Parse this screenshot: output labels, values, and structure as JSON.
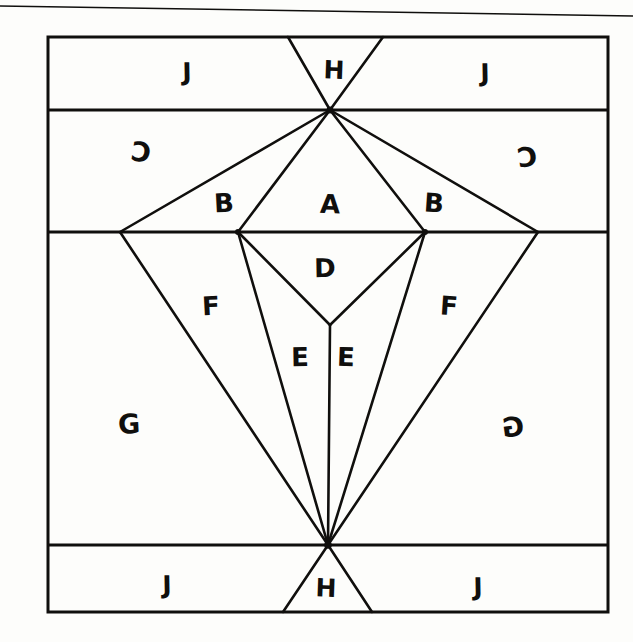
{
  "document": {
    "title": "Hand-drawn geometric partition diagram",
    "background_color": "#fdfdfb",
    "ink_color": "#100f0d"
  },
  "scan_artifact": {
    "name": "page-edge-line",
    "description": "thin slanted scan line across the top of the page",
    "x1": 0,
    "y1": 6,
    "x2": 633,
    "y2": 16
  },
  "frame": {
    "left": 48,
    "top": 37,
    "right": 608,
    "bottom": 612,
    "stroke_width": 3
  },
  "guides": {
    "horizontal_lines": [
      110,
      232,
      545
    ]
  },
  "vertices": {
    "top_apex": {
      "x": 330,
      "y": 110
    },
    "bottom_apex": {
      "x": 328,
      "y": 545
    },
    "diamond_bottom": {
      "x": 330,
      "y": 325
    },
    "mid_outer_left": {
      "x": 120,
      "y": 232
    },
    "mid_inner_left": {
      "x": 238,
      "y": 232
    },
    "mid_inner_right": {
      "x": 425,
      "y": 232
    },
    "mid_outer_right": {
      "x": 538,
      "y": 232
    },
    "top_h_left": {
      "x": 288,
      "y": 37
    },
    "top_h_right": {
      "x": 383,
      "y": 37
    },
    "bottom_h_left": {
      "x": 283,
      "y": 612
    },
    "bottom_h_right": {
      "x": 372,
      "y": 612
    }
  },
  "labels": [
    {
      "id": "j-top-left",
      "text": "J",
      "x": 187,
      "y": 72,
      "size": 25,
      "style": "lbl-rot-c"
    },
    {
      "id": "h-top",
      "text": "H",
      "x": 334,
      "y": 70,
      "size": 25,
      "style": "lbl-rot-b"
    },
    {
      "id": "j-top-right",
      "text": "J",
      "x": 485,
      "y": 73,
      "size": 25,
      "style": "lbl-rot-c"
    },
    {
      "id": "c-left",
      "text": "C",
      "x": 141,
      "y": 152,
      "size": 27,
      "style": "lbl-flip"
    },
    {
      "id": "c-right",
      "text": "C",
      "x": 527,
      "y": 157,
      "size": 27,
      "style": "lbl-flip2"
    },
    {
      "id": "b-left",
      "text": "B",
      "x": 224,
      "y": 203,
      "size": 26,
      "style": "lbl-rot-a"
    },
    {
      "id": "a-center",
      "text": "A",
      "x": 330,
      "y": 204,
      "size": 26,
      "style": "lbl-rot-b"
    },
    {
      "id": "b-right",
      "text": "B",
      "x": 434,
      "y": 203,
      "size": 26,
      "style": "lbl-rot-d"
    },
    {
      "id": "d-center",
      "text": "D",
      "x": 325,
      "y": 268,
      "size": 26,
      "style": "lbl-rot-c"
    },
    {
      "id": "f-left",
      "text": "F",
      "x": 211,
      "y": 306,
      "size": 26,
      "style": "lbl-rot-a"
    },
    {
      "id": "f-right",
      "text": "F",
      "x": 449,
      "y": 306,
      "size": 26,
      "style": "lbl-rot-d"
    },
    {
      "id": "e-left",
      "text": "E",
      "x": 300,
      "y": 357,
      "size": 26,
      "style": "lbl-rot-c"
    },
    {
      "id": "e-right",
      "text": "E",
      "x": 346,
      "y": 357,
      "size": 26,
      "style": "lbl-rot-b"
    },
    {
      "id": "g-left",
      "text": "G",
      "x": 129,
      "y": 424,
      "size": 27,
      "style": "lbl-rot-a"
    },
    {
      "id": "g-right",
      "text": "G",
      "x": 513,
      "y": 427,
      "size": 27,
      "style": "lbl-flip2"
    },
    {
      "id": "j-bottom-left",
      "text": "J",
      "x": 167,
      "y": 585,
      "size": 25,
      "style": "lbl-rot-c"
    },
    {
      "id": "h-bottom",
      "text": "H",
      "x": 326,
      "y": 588,
      "size": 25,
      "style": "lbl-rot-b"
    },
    {
      "id": "j-bottom-right",
      "text": "J",
      "x": 478,
      "y": 587,
      "size": 25,
      "style": "lbl-rot-c"
    }
  ],
  "region_names": [
    "A",
    "B",
    "C",
    "D",
    "E",
    "F",
    "G",
    "H",
    "J"
  ],
  "segments": [
    {
      "name": "top-h-left-edge",
      "x1": 288,
      "y1": 37,
      "x2": 330,
      "y2": 110
    },
    {
      "name": "top-h-right-edge",
      "x1": 383,
      "y1": 37,
      "x2": 330,
      "y2": 110
    },
    {
      "name": "apex-to-outer-left",
      "x1": 330,
      "y1": 110,
      "x2": 120,
      "y2": 232
    },
    {
      "name": "apex-to-inner-left",
      "x1": 330,
      "y1": 110,
      "x2": 238,
      "y2": 232
    },
    {
      "name": "apex-to-inner-right",
      "x1": 330,
      "y1": 110,
      "x2": 425,
      "y2": 232
    },
    {
      "name": "apex-to-outer-right",
      "x1": 330,
      "y1": 110,
      "x2": 538,
      "y2": 232
    },
    {
      "name": "inner-left-to-diamond",
      "x1": 238,
      "y1": 232,
      "x2": 330,
      "y2": 325
    },
    {
      "name": "inner-right-to-diamond",
      "x1": 425,
      "y1": 232,
      "x2": 330,
      "y2": 325
    },
    {
      "name": "diamond-to-bottom-apex",
      "x1": 330,
      "y1": 325,
      "x2": 328,
      "y2": 545
    },
    {
      "name": "inner-left-to-bottom",
      "x1": 238,
      "y1": 232,
      "x2": 328,
      "y2": 545
    },
    {
      "name": "inner-right-to-bottom",
      "x1": 425,
      "y1": 232,
      "x2": 328,
      "y2": 545
    },
    {
      "name": "outer-left-to-bottom",
      "x1": 120,
      "y1": 232,
      "x2": 328,
      "y2": 545
    },
    {
      "name": "outer-right-to-bottom",
      "x1": 538,
      "y1": 232,
      "x2": 328,
      "y2": 545
    },
    {
      "name": "bottom-h-left-edge",
      "x1": 328,
      "y1": 545,
      "x2": 283,
      "y2": 612
    },
    {
      "name": "bottom-h-right-edge",
      "x1": 328,
      "y1": 545,
      "x2": 372,
      "y2": 612
    }
  ]
}
